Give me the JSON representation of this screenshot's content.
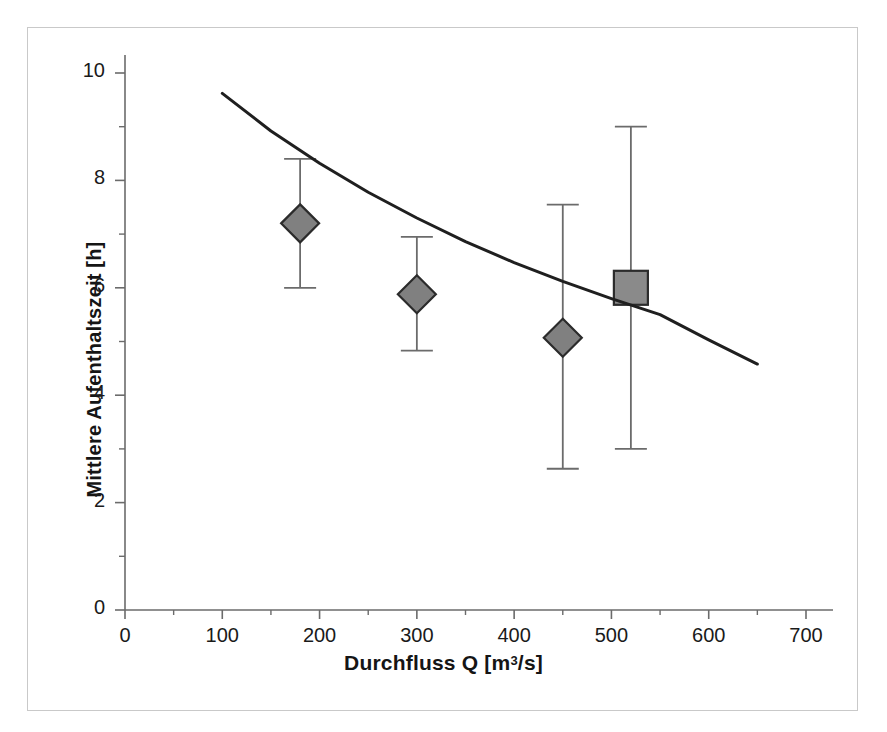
{
  "figure": {
    "background_color": "#ffffff",
    "frame_color": "#c9c9c9"
  },
  "chart_data": {
    "type": "scatter",
    "title": "",
    "xlabel_prefix": "Durchfluss Q [m",
    "xlabel_sup": "3",
    "xlabel_suffix": "/s]",
    "xlabel": "Durchfluss Q [m3/s]",
    "ylabel": "Mittlere Aufenthaltszeit [h]",
    "xlim": [
      0,
      700
    ],
    "ylim": [
      0,
      10
    ],
    "xticks": [
      0,
      100,
      200,
      300,
      400,
      500,
      600,
      700
    ],
    "xtick_labels": [
      "0",
      "100",
      "200",
      "300",
      "400",
      "500",
      "600",
      "700"
    ],
    "xminor_ticks": [
      50,
      150,
      250,
      350,
      450,
      550,
      650
    ],
    "yticks": [
      0,
      2,
      4,
      6,
      8,
      10
    ],
    "ytick_labels": [
      "0",
      "2",
      "4",
      "6",
      "8",
      "10"
    ],
    "yminor_ticks": [
      1,
      3,
      5,
      7,
      9
    ],
    "grid": false,
    "legend": null,
    "axis_color": "#6b6b6b",
    "series": [
      {
        "name": "Messwerte (Raute)",
        "marker": "diamond",
        "marker_fill": "#808080",
        "marker_edge": "#2b2b2b",
        "error_bar_color": "#6b6b6b",
        "points": [
          {
            "x": 180,
            "y": 7.2,
            "y_low": 6.0,
            "y_high": 8.4
          },
          {
            "x": 300,
            "y": 5.88,
            "y_low": 4.83,
            "y_high": 6.95
          },
          {
            "x": 450,
            "y": 5.07,
            "y_low": 2.63,
            "y_high": 7.55
          }
        ]
      },
      {
        "name": "Messwert (Quadrat)",
        "marker": "square",
        "marker_fill": "#8a8a8a",
        "marker_edge": "#2b2b2b",
        "error_bar_color": "#6b6b6b",
        "points": [
          {
            "x": 520,
            "y": 6.0,
            "y_low": 3.0,
            "y_high": 9.0
          }
        ]
      },
      {
        "name": "Modellkurve",
        "marker": "none",
        "line_color": "#1f1f1f",
        "line_width": 3,
        "curve": [
          {
            "x": 100,
            "y": 9.62
          },
          {
            "x": 150,
            "y": 8.92
          },
          {
            "x": 200,
            "y": 8.32
          },
          {
            "x": 250,
            "y": 7.78
          },
          {
            "x": 300,
            "y": 7.3
          },
          {
            "x": 350,
            "y": 6.86
          },
          {
            "x": 400,
            "y": 6.47
          },
          {
            "x": 450,
            "y": 6.12
          },
          {
            "x": 500,
            "y": 5.8
          },
          {
            "x": 550,
            "y": 5.5
          },
          {
            "x": 600,
            "y": 5.03
          },
          {
            "x": 650,
            "y": 4.58
          }
        ]
      }
    ]
  }
}
